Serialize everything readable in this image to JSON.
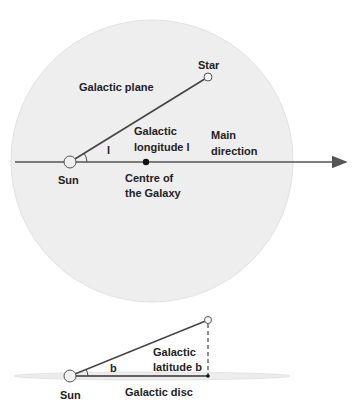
{
  "top_diagram": {
    "region_label": "Galactic plane",
    "star_label": "Star",
    "sun_label": "Sun",
    "angle_symbol": "l",
    "angle_label_line1": "Galactic",
    "angle_label_line2": "longitude l",
    "direction_label_line1": "Main",
    "direction_label_line2": "direction",
    "centre_label_line1": "Centre of",
    "centre_label_line2": "the Galaxy"
  },
  "bottom_diagram": {
    "sun_label": "Sun",
    "angle_symbol": "b",
    "angle_label_line1": "Galactic",
    "angle_label_line2": "latitude b",
    "disc_label": "Galactic disc"
  },
  "colors": {
    "plane_fill": "#eeeeee",
    "line": "#444444",
    "text": "#222222"
  }
}
